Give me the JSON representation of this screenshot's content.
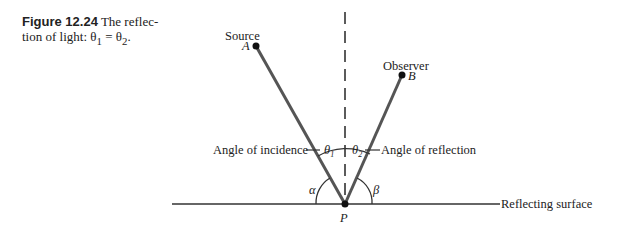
{
  "caption": {
    "figure_label": "Figure 12.24",
    "text_line1": " The reflec-",
    "text_line2": "tion of light: θ",
    "sub1": "1",
    "eq": " = θ",
    "sub2": "2",
    "end": "."
  },
  "labels": {
    "source": "Source",
    "point_a": "A",
    "observer": "Observer",
    "point_b": "B",
    "angle_incidence": "Angle of incidence",
    "angle_reflection": "Angle of reflection",
    "theta1": "θ",
    "theta1_sub": "1",
    "theta2": "θ",
    "theta2_sub": "2",
    "alpha": "α",
    "beta": "β",
    "point_p": "P",
    "surface": "Reflecting surface"
  },
  "colors": {
    "ray": "#555555",
    "line": "#333333"
  }
}
